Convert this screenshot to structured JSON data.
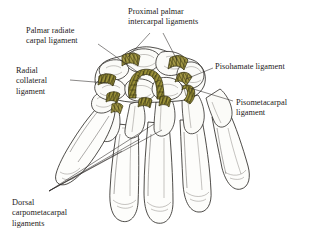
{
  "figure": {
    "background_color": "#ffffff",
    "ink_color": "#221f1c",
    "ligament_color": "#8d8432",
    "ligament_color_light": "#b6ab55",
    "bone_fill": "#fdfdfb",
    "text_color": "#1c1a18"
  },
  "labels": [
    {
      "id": "palmar-radiate-carpal-ligament",
      "lines": [
        "Palmar radiate",
        "carpal ligament"
      ],
      "text": "Palmar radiate\ncarpal ligament",
      "x": 26,
      "y": 26,
      "align": "left"
    },
    {
      "id": "proximal-palmar-intercarpal-ligaments",
      "lines": [
        "Proximal palmar",
        "intercarpal ligaments"
      ],
      "text": "Proximal palmar\nintercarpal ligaments",
      "x": 128,
      "y": 7,
      "align": "left"
    },
    {
      "id": "radial-collateral-ligament",
      "lines": [
        "Radial",
        "collateral",
        "ligament"
      ],
      "text": "Radial\ncollateral\nligament",
      "x": 16,
      "y": 66,
      "align": "left"
    },
    {
      "id": "pisohamate-ligament",
      "lines": [
        "Pisohamate ligament"
      ],
      "text": "Pisohamate ligament",
      "x": 215,
      "y": 62,
      "align": "left"
    },
    {
      "id": "pisometacarpal-ligament",
      "lines": [
        "Pisometacarpal",
        "ligament"
      ],
      "text": "Pisometacarpal\nligament",
      "x": 236,
      "y": 98,
      "align": "left"
    },
    {
      "id": "dorsal-carpometacarpal-ligaments",
      "lines": [
        "Dorsal",
        "carpometacarpal",
        "ligaments"
      ],
      "text": "Dorsal\ncarpometacarpal\nligaments",
      "x": 12,
      "y": 198,
      "align": "left"
    }
  ],
  "leader_lines": [
    {
      "id": "leader-palmar-radiate",
      "from": [
        98,
        44
      ],
      "to": [
        139,
        73
      ]
    },
    {
      "id": "leader-proximal-intercarpal-a",
      "from": [
        150,
        33
      ],
      "to": [
        128,
        57
      ]
    },
    {
      "id": "leader-proximal-intercarpal-b",
      "from": [
        163,
        33
      ],
      "to": [
        176,
        60
      ]
    },
    {
      "id": "leader-radial-collateral",
      "from": [
        70,
        80
      ],
      "to": [
        107,
        83
      ]
    },
    {
      "id": "leader-pisohamate",
      "from": [
        213,
        68
      ],
      "to": [
        186,
        79
      ]
    },
    {
      "id": "leader-pisometacarpal",
      "from": [
        233,
        101
      ],
      "to": [
        190,
        88
      ]
    },
    {
      "id": "leader-dorsal-a",
      "from": [
        49,
        191
      ],
      "to": [
        152,
        126
      ]
    },
    {
      "id": "leader-dorsal-b",
      "from": [
        49,
        191
      ],
      "to": [
        160,
        131
      ]
    },
    {
      "id": "leader-dorsal-c",
      "from": [
        49,
        191
      ],
      "to": [
        140,
        139
      ]
    },
    {
      "id": "leader-dorsal-d",
      "from": [
        49,
        191
      ],
      "to": [
        124,
        150
      ]
    }
  ],
  "anatomy": {
    "structures": [
      "carpal bones",
      "metacarpal bones",
      "proximal phalanges",
      "middle phalanges",
      "distal phalanges",
      "thumb",
      "radius",
      "ulna"
    ],
    "highlighted_ligaments": [
      "palmar radiate carpal ligament",
      "proximal palmar intercarpal ligaments",
      "radial collateral ligament",
      "pisohamate ligament",
      "pisometacarpal ligament"
    ]
  }
}
